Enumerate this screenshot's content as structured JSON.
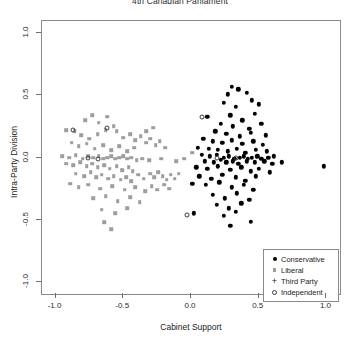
{
  "chart_data": {
    "type": "scatter",
    "title": "4th Canadian Parliament",
    "xlabel": "Cabinet Support",
    "ylabel": "Intra-Party Division",
    "xlim": [
      -1.1,
      1.1
    ],
    "ylim": [
      -1.1,
      1.1
    ],
    "xticks": [
      -1.0,
      -0.5,
      0.0,
      0.5,
      1.0
    ],
    "yticks": [
      -1.0,
      -0.5,
      0.0,
      0.5,
      1.0
    ],
    "xticklabels": [
      "-1.0",
      "-0.5",
      "0.0",
      "0.5",
      "1.0"
    ],
    "yticklabels": [
      "-1.0",
      "-0.5",
      "0.0",
      "0.5",
      "1.0"
    ],
    "grid": false,
    "legend_position": "bottom-right",
    "series": [
      {
        "name": "Conservative",
        "marker": "filled-circle",
        "color": "#000000",
        "points": [
          [
            0.3,
            0.57
          ],
          [
            0.35,
            0.55
          ],
          [
            0.27,
            0.51
          ],
          [
            0.41,
            0.52
          ],
          [
            0.24,
            0.44
          ],
          [
            0.33,
            0.41
          ],
          [
            0.45,
            0.46
          ],
          [
            0.5,
            0.43
          ],
          [
            0.12,
            0.33
          ],
          [
            0.29,
            0.34
          ],
          [
            0.38,
            0.3
          ],
          [
            0.47,
            0.35
          ],
          [
            0.22,
            0.27
          ],
          [
            0.31,
            0.25
          ],
          [
            0.43,
            0.23
          ],
          [
            0.52,
            0.27
          ],
          [
            0.18,
            0.21
          ],
          [
            0.26,
            0.19
          ],
          [
            0.36,
            0.17
          ],
          [
            0.44,
            0.2
          ],
          [
            0.55,
            0.18
          ],
          [
            0.09,
            0.15
          ],
          [
            0.16,
            0.13
          ],
          [
            0.23,
            0.12
          ],
          [
            0.3,
            0.14
          ],
          [
            0.38,
            0.11
          ],
          [
            0.46,
            0.13
          ],
          [
            0.53,
            0.1
          ],
          [
            0.05,
            0.08
          ],
          [
            0.13,
            0.07
          ],
          [
            0.2,
            0.06
          ],
          [
            0.27,
            0.05
          ],
          [
            0.34,
            0.07
          ],
          [
            0.4,
            0.04
          ],
          [
            0.48,
            0.06
          ],
          [
            0.56,
            0.05
          ],
          [
            0.08,
            0.02
          ],
          [
            0.14,
            0.01
          ],
          [
            0.19,
            0.02
          ],
          [
            0.24,
            0.0
          ],
          [
            0.28,
            0.01
          ],
          [
            0.32,
            -0.01
          ],
          [
            0.36,
            0.0
          ],
          [
            0.39,
            0.01
          ],
          [
            0.42,
            -0.01
          ],
          [
            0.45,
            0.0
          ],
          [
            0.49,
            0.01
          ],
          [
            0.52,
            -0.01
          ],
          [
            0.57,
            0.0
          ],
          [
            0.61,
            0.01
          ],
          [
            0.1,
            -0.03
          ],
          [
            0.17,
            -0.04
          ],
          [
            0.22,
            -0.02
          ],
          [
            0.26,
            -0.04
          ],
          [
            0.31,
            -0.03
          ],
          [
            0.35,
            -0.05
          ],
          [
            0.41,
            -0.03
          ],
          [
            0.47,
            -0.04
          ],
          [
            0.54,
            -0.03
          ],
          [
            0.6,
            -0.05
          ],
          [
            0.67,
            -0.04
          ],
          [
            0.04,
            -0.08
          ],
          [
            0.12,
            -0.09
          ],
          [
            0.2,
            -0.07
          ],
          [
            0.29,
            -0.1
          ],
          [
            0.37,
            -0.08
          ],
          [
            0.44,
            -0.11
          ],
          [
            0.5,
            -0.09
          ],
          [
            0.58,
            -0.12
          ],
          [
            0.98,
            -0.07
          ],
          [
            0.06,
            -0.15
          ],
          [
            0.15,
            -0.17
          ],
          [
            0.23,
            -0.14
          ],
          [
            0.33,
            -0.16
          ],
          [
            0.4,
            -0.19
          ],
          [
            0.48,
            -0.15
          ],
          [
            0.01,
            -0.21
          ],
          [
            0.11,
            -0.22
          ],
          [
            0.21,
            -0.2
          ],
          [
            0.3,
            -0.24
          ],
          [
            0.39,
            -0.22
          ],
          [
            0.46,
            -0.26
          ],
          [
            0.16,
            -0.3
          ],
          [
            0.25,
            -0.33
          ],
          [
            0.34,
            -0.29
          ],
          [
            0.43,
            -0.34
          ],
          [
            0.19,
            -0.38
          ],
          [
            0.28,
            -0.41
          ],
          [
            0.37,
            -0.37
          ],
          [
            0.02,
            -0.45
          ],
          [
            0.24,
            -0.47
          ],
          [
            0.33,
            -0.44
          ],
          [
            0.44,
            -0.52
          ],
          [
            0.29,
            -0.55
          ]
        ]
      },
      {
        "name": "Liberal",
        "marker": "square",
        "color": "#9d9d9d",
        "points": [
          [
            -0.92,
            0.22
          ],
          [
            -0.86,
            0.21
          ],
          [
            -0.78,
            0.3
          ],
          [
            -0.73,
            0.34
          ],
          [
            -0.68,
            0.28
          ],
          [
            -0.62,
            0.33
          ],
          [
            -0.57,
            0.25
          ],
          [
            -0.81,
            0.18
          ],
          [
            -0.75,
            0.15
          ],
          [
            -0.69,
            0.19
          ],
          [
            -0.63,
            0.22
          ],
          [
            -0.55,
            0.21
          ],
          [
            -0.5,
            0.16
          ],
          [
            -0.45,
            0.19
          ],
          [
            -0.41,
            0.14
          ],
          [
            -0.37,
            0.17
          ],
          [
            -0.33,
            0.12
          ],
          [
            -0.3,
            0.15
          ],
          [
            -0.26,
            0.1
          ],
          [
            -0.23,
            0.13
          ],
          [
            -0.19,
            0.08
          ],
          [
            -0.33,
            0.21
          ],
          [
            -0.28,
            0.24
          ],
          [
            -0.88,
            0.12
          ],
          [
            -0.83,
            0.09
          ],
          [
            -0.77,
            0.11
          ],
          [
            -0.71,
            0.07
          ],
          [
            -0.65,
            0.1
          ],
          [
            -0.59,
            0.06
          ],
          [
            -0.53,
            0.09
          ],
          [
            -0.47,
            0.05
          ],
          [
            -0.42,
            0.08
          ],
          [
            -0.95,
            0.01
          ],
          [
            -0.9,
            0.0
          ],
          [
            -0.85,
            0.02
          ],
          [
            -0.8,
            -0.01
          ],
          [
            -0.76,
            0.01
          ],
          [
            -0.72,
            0.0
          ],
          [
            -0.68,
            0.01
          ],
          [
            -0.65,
            -0.01
          ],
          [
            -0.62,
            0.0
          ],
          [
            -0.59,
            0.01
          ],
          [
            -0.56,
            -0.01
          ],
          [
            -0.53,
            0.0
          ],
          [
            -0.5,
            0.01
          ],
          [
            -0.47,
            -0.01
          ],
          [
            -0.44,
            0.0
          ],
          [
            -0.4,
            -0.02
          ],
          [
            -0.36,
            -0.01
          ],
          [
            -0.31,
            -0.02
          ],
          [
            -0.22,
            -0.01
          ],
          [
            -0.11,
            -0.03
          ],
          [
            -0.92,
            -0.05
          ],
          [
            -0.87,
            -0.06
          ],
          [
            -0.82,
            -0.04
          ],
          [
            -0.77,
            -0.07
          ],
          [
            -0.73,
            -0.05
          ],
          [
            -0.69,
            -0.08
          ],
          [
            -0.64,
            -0.06
          ],
          [
            -0.6,
            -0.09
          ],
          [
            -0.55,
            -0.07
          ],
          [
            -0.51,
            -0.1
          ],
          [
            -0.46,
            -0.08
          ],
          [
            -0.43,
            -0.11
          ],
          [
            -0.85,
            -0.13
          ],
          [
            -0.79,
            -0.15
          ],
          [
            -0.74,
            -0.12
          ],
          [
            -0.7,
            -0.16
          ],
          [
            -0.66,
            -0.14
          ],
          [
            -0.61,
            -0.17
          ],
          [
            -0.57,
            -0.15
          ],
          [
            -0.52,
            -0.18
          ],
          [
            -0.48,
            -0.16
          ],
          [
            -0.44,
            -0.19
          ],
          [
            -0.39,
            -0.14
          ],
          [
            -0.35,
            -0.17
          ],
          [
            -0.3,
            -0.13
          ],
          [
            -0.27,
            -0.16
          ],
          [
            -0.24,
            -0.12
          ],
          [
            -0.21,
            -0.15
          ],
          [
            -0.18,
            -0.18
          ],
          [
            -0.15,
            -0.14
          ],
          [
            -0.12,
            -0.17
          ],
          [
            -0.09,
            -0.13
          ],
          [
            -0.89,
            -0.21
          ],
          [
            -0.83,
            -0.24
          ],
          [
            -0.76,
            -0.22
          ],
          [
            -0.67,
            -0.25
          ],
          [
            -0.58,
            -0.23
          ],
          [
            -0.49,
            -0.26
          ],
          [
            -0.41,
            -0.24
          ],
          [
            -0.34,
            -0.27
          ],
          [
            -0.29,
            -0.23
          ],
          [
            -0.25,
            -0.26
          ],
          [
            -0.2,
            -0.22
          ],
          [
            -0.16,
            -0.25
          ],
          [
            -0.72,
            -0.33
          ],
          [
            -0.63,
            -0.31
          ],
          [
            -0.54,
            -0.35
          ],
          [
            -0.45,
            -0.32
          ],
          [
            -0.38,
            -0.36
          ],
          [
            -0.66,
            -0.42
          ],
          [
            -0.56,
            -0.45
          ],
          [
            -0.47,
            -0.41
          ],
          [
            -0.64,
            -0.52
          ],
          [
            -0.59,
            -0.58
          ],
          [
            -0.05,
            -0.01
          ],
          [
            0.01,
            0.04
          ]
        ]
      },
      {
        "name": "Third Party",
        "marker": "plus",
        "color": "#6f6f6f",
        "points": []
      },
      {
        "name": "Independent",
        "marker": "open-circle",
        "color": "#3a3a3a",
        "points": [
          [
            -0.87,
            0.22
          ],
          [
            -0.62,
            0.24
          ],
          [
            -0.76,
            0.0
          ],
          [
            -0.69,
            -0.01
          ],
          [
            0.08,
            0.33
          ],
          [
            0.19,
            0.0
          ],
          [
            0.33,
            0.0
          ],
          [
            -0.03,
            -0.46
          ]
        ]
      }
    ]
  },
  "legend": {
    "items": [
      {
        "label": "Conservative",
        "marker": "filled-circle"
      },
      {
        "label": "Liberal",
        "marker": "square"
      },
      {
        "label": "Third Party",
        "marker": "plus"
      },
      {
        "label": "Independent",
        "marker": "open-circle"
      }
    ]
  }
}
